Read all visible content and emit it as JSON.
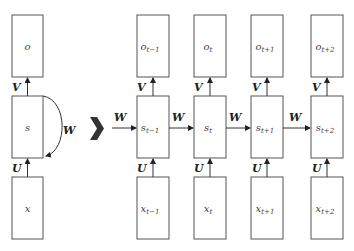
{
  "folded": {
    "output": "o",
    "state": "s",
    "input": "x",
    "weights": {
      "V": "V",
      "U": "U",
      "W": "W"
    }
  },
  "unfold_symbol": "chevron-right",
  "unfolded": {
    "steps": [
      {
        "o": "o",
        "s": "s",
        "x": "x",
        "sub": "t−1"
      },
      {
        "o": "o",
        "s": "s",
        "x": "x",
        "sub": "t"
      },
      {
        "o": "o",
        "s": "s",
        "x": "x",
        "sub": "t+1"
      },
      {
        "o": "o",
        "s": "s",
        "x": "x",
        "sub": "t+2"
      }
    ],
    "weights": {
      "V": "V",
      "U": "U",
      "W": "W"
    }
  },
  "colors": {
    "stroke": "#555555",
    "text": "#444444",
    "chevron": "#333333"
  }
}
